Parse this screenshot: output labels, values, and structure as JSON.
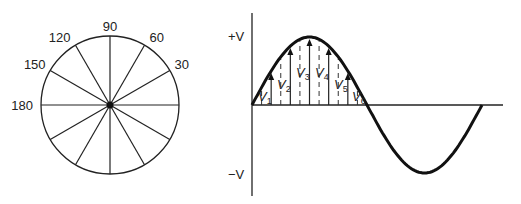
{
  "figure": {
    "phasor_circle": {
      "center": [
        110,
        105
      ],
      "radius": 69,
      "spoke_angles_deg": [
        0,
        30,
        60,
        90,
        120,
        150,
        180,
        210,
        240,
        270,
        300,
        330
      ],
      "labels": [
        {
          "text": "90",
          "angle": 90
        },
        {
          "text": "60",
          "angle": 60
        },
        {
          "text": "30",
          "angle": 30
        },
        {
          "text": "120",
          "angle": 120
        },
        {
          "text": "150",
          "angle": 150
        },
        {
          "text": "180",
          "angle": 180
        }
      ]
    },
    "sine_wave": {
      "pos_label": "+V",
      "neg_label": "−V",
      "instantaneous_labels": [
        {
          "main": "V",
          "sub": "1"
        },
        {
          "main": "V",
          "sub": "2"
        },
        {
          "main": "V",
          "sub": "3"
        },
        {
          "main": "V",
          "sub": "4"
        },
        {
          "main": "V",
          "sub": "5"
        },
        {
          "main": "V",
          "sub": "6"
        }
      ],
      "arrow_angles_deg": [
        30,
        60,
        90,
        120,
        150
      ],
      "dashed_angles_deg": [
        15,
        45,
        75,
        105,
        135,
        165
      ]
    }
  },
  "chart_data": {
    "type": "line",
    "title": "",
    "xlabel": "",
    "ylabel": "",
    "y_ticks": [
      "+V",
      "−V"
    ],
    "x": [
      0,
      30,
      60,
      90,
      120,
      150,
      180,
      210,
      240,
      270,
      300,
      330,
      360
    ],
    "series": [
      {
        "name": "v = V sin(θ)",
        "values": [
          0,
          0.5,
          0.866,
          1,
          0.866,
          0.5,
          0,
          -0.5,
          -0.866,
          -1,
          -0.866,
          -0.5,
          0
        ]
      }
    ],
    "annotations": [
      "V1",
      "V2",
      "V3",
      "V4",
      "V5",
      "V6"
    ],
    "circle_angle_labels": [
      "30",
      "60",
      "90",
      "120",
      "150",
      "180"
    ]
  }
}
